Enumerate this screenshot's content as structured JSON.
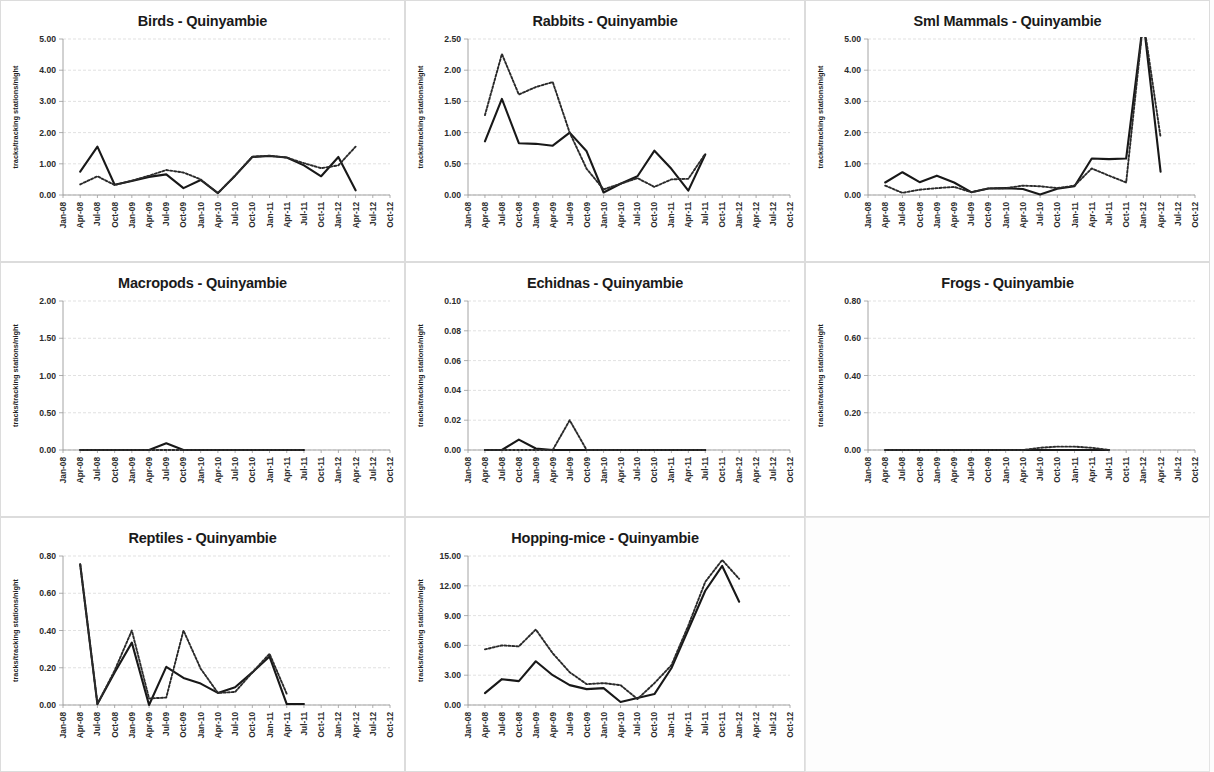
{
  "document": {
    "y_axis_label": "tracks/tracking stations/night",
    "site": "Quinyambie",
    "x_categories": [
      "Jan-08",
      "Apr-08",
      "Jul-08",
      "Oct-08",
      "Jan-09",
      "Apr-09",
      "Jul-09",
      "Oct-09",
      "Jan-10",
      "Apr-10",
      "Jul-10",
      "Oct-10",
      "Jan-11",
      "Apr-11",
      "Jul-11",
      "Oct-11",
      "Jan-12",
      "Apr-12",
      "Jul-12",
      "Oct-12"
    ],
    "colors": {
      "line": "#181818",
      "grid": "#d9d9d9",
      "axis": "#9a9a9a",
      "panel_border": "#dcdcdc",
      "text": "#1a1a1a"
    }
  },
  "chart_data": [
    {
      "id": "birds",
      "type": "line",
      "title": "Birds - Quinyambie",
      "xlabel": "",
      "ylabel": "tracks/tracking stations/night",
      "ylim": [
        0,
        5
      ],
      "yticks": [
        0,
        1,
        2,
        3,
        4,
        5
      ],
      "ytick_labels": [
        "0.00",
        "1.00",
        "2.00",
        "3.00",
        "4.00",
        "5.00"
      ],
      "grid": true,
      "x": [
        "Jan-08",
        "Apr-08",
        "Jul-08",
        "Oct-08",
        "Jan-09",
        "Apr-09",
        "Jul-09",
        "Oct-09",
        "Jan-10",
        "Apr-10",
        "Jul-10",
        "Oct-10",
        "Jan-11",
        "Apr-11",
        "Jul-11",
        "Oct-11",
        "Jan-12",
        "Apr-12",
        "Jul-12",
        "Oct-12"
      ],
      "series": [
        {
          "name": "solid",
          "style": "solid",
          "values": [
            null,
            0.75,
            1.55,
            0.33,
            0.45,
            0.58,
            0.66,
            0.22,
            0.48,
            0.06,
            0.62,
            1.22,
            1.25,
            1.2,
            0.95,
            0.6,
            1.22,
            0.15,
            null,
            null
          ]
        },
        {
          "name": "dotted",
          "style": "dotted",
          "values": [
            null,
            0.34,
            0.6,
            0.32,
            0.46,
            0.62,
            0.8,
            0.72,
            0.5,
            0.06,
            0.62,
            1.23,
            1.26,
            1.2,
            1.02,
            0.86,
            0.95,
            1.55,
            null,
            null
          ]
        }
      ]
    },
    {
      "id": "rabbits",
      "type": "line",
      "title": "Rabbits - Quinyambie",
      "xlabel": "",
      "ylabel": "tracks/tracking stations/night",
      "ylim": [
        0,
        2.5
      ],
      "yticks": [
        0,
        0.5,
        1.0,
        1.5,
        2.0,
        2.5
      ],
      "ytick_labels": [
        "0.00",
        "0.50",
        "1.00",
        "1.50",
        "2.00",
        "2.50"
      ],
      "grid": true,
      "x": [
        "Jan-08",
        "Apr-08",
        "Jul-08",
        "Oct-08",
        "Jan-09",
        "Apr-09",
        "Jul-09",
        "Oct-09",
        "Jan-10",
        "Apr-10",
        "Jul-10",
        "Oct-10",
        "Jan-11",
        "Apr-11",
        "Jul-11",
        "Oct-11",
        "Jan-12",
        "Apr-12",
        "Jul-12",
        "Oct-12"
      ],
      "series": [
        {
          "name": "solid",
          "style": "solid",
          "values": [
            null,
            0.86,
            1.54,
            0.83,
            0.82,
            0.79,
            1.0,
            0.7,
            0.04,
            0.18,
            0.3,
            0.71,
            0.42,
            0.07,
            0.65,
            null,
            null,
            null,
            null,
            null
          ]
        },
        {
          "name": "dotted",
          "style": "dotted",
          "values": [
            null,
            1.28,
            2.26,
            1.61,
            1.73,
            1.81,
            1.0,
            0.42,
            0.09,
            0.18,
            0.27,
            0.13,
            0.25,
            0.26,
            0.66,
            null,
            null,
            null,
            null,
            null
          ]
        }
      ]
    },
    {
      "id": "sml-mammals",
      "type": "line",
      "title": "Sml Mammals - Quinyambie",
      "xlabel": "",
      "ylabel": "tracks/tracking stations/night",
      "ylim": [
        0,
        5
      ],
      "yticks": [
        0,
        1,
        2,
        3,
        4,
        5
      ],
      "ytick_labels": [
        "0.00",
        "1.00",
        "2.00",
        "3.00",
        "4.00",
        "5.00"
      ],
      "grid": true,
      "x": [
        "Jan-08",
        "Apr-08",
        "Jul-08",
        "Oct-08",
        "Jan-09",
        "Apr-09",
        "Jul-09",
        "Oct-09",
        "Jan-10",
        "Apr-10",
        "Jul-10",
        "Oct-10",
        "Jan-11",
        "Apr-11",
        "Jul-11",
        "Oct-11",
        "Jan-12",
        "Apr-12",
        "Jul-12",
        "Oct-12"
      ],
      "series": [
        {
          "name": "solid",
          "style": "solid",
          "values": [
            null,
            0.4,
            0.73,
            0.41,
            0.62,
            0.4,
            0.09,
            0.21,
            0.22,
            0.19,
            0.02,
            0.2,
            0.28,
            1.17,
            1.15,
            1.17,
            5.6,
            0.75,
            null,
            null
          ]
        },
        {
          "name": "dotted",
          "style": "dotted",
          "values": [
            null,
            0.3,
            0.07,
            0.17,
            0.22,
            0.26,
            0.09,
            0.21,
            0.22,
            0.3,
            0.28,
            0.22,
            0.3,
            0.85,
            0.62,
            0.4,
            5.6,
            1.85,
            null,
            null
          ]
        }
      ]
    },
    {
      "id": "macropods",
      "type": "line",
      "title": "Macropods - Quinyambie",
      "xlabel": "",
      "ylabel": "tracks/tracking stations/night",
      "ylim": [
        0,
        2
      ],
      "yticks": [
        0,
        0.5,
        1.0,
        1.5,
        2.0
      ],
      "ytick_labels": [
        "0.00",
        "0.50",
        "1.00",
        "1.50",
        "2.00"
      ],
      "grid": true,
      "x": [
        "Jan-08",
        "Apr-08",
        "Jul-08",
        "Oct-08",
        "Jan-09",
        "Apr-09",
        "Jul-09",
        "Oct-09",
        "Jan-10",
        "Apr-10",
        "Jul-10",
        "Oct-10",
        "Jan-11",
        "Apr-11",
        "Jul-11",
        "Oct-11",
        "Jan-12",
        "Apr-12",
        "Jul-12",
        "Oct-12"
      ],
      "series": [
        {
          "name": "solid",
          "style": "solid",
          "values": [
            null,
            0.0,
            0.0,
            0.0,
            0.0,
            0.0,
            0.09,
            0.0,
            0.0,
            0.0,
            0.0,
            0.0,
            0.0,
            0.0,
            0.0,
            null,
            null,
            null,
            null,
            null
          ]
        },
        {
          "name": "dotted",
          "style": "dotted",
          "values": [
            null,
            0.0,
            0.0,
            0.0,
            0.0,
            0.0,
            0.0,
            0.0,
            0.0,
            0.0,
            0.0,
            0.0,
            0.0,
            0.0,
            0.0,
            null,
            null,
            null,
            null,
            null
          ]
        }
      ]
    },
    {
      "id": "echidnas",
      "type": "line",
      "title": "Echidnas - Quinyambie",
      "xlabel": "",
      "ylabel": "tracks/tracking stations/night",
      "ylim": [
        0,
        0.1
      ],
      "yticks": [
        0,
        0.02,
        0.04,
        0.06,
        0.08,
        0.1
      ],
      "ytick_labels": [
        "0.00",
        "0.02",
        "0.04",
        "0.06",
        "0.08",
        "0.10"
      ],
      "grid": true,
      "x": [
        "Jan-08",
        "Apr-08",
        "Jul-08",
        "Oct-08",
        "Jan-09",
        "Apr-09",
        "Jul-09",
        "Oct-09",
        "Jan-10",
        "Apr-10",
        "Jul-10",
        "Oct-10",
        "Jan-11",
        "Apr-11",
        "Jul-11",
        "Oct-11",
        "Jan-12",
        "Apr-12",
        "Jul-12",
        "Oct-12"
      ],
      "series": [
        {
          "name": "solid",
          "style": "solid",
          "values": [
            null,
            0.0,
            0.0,
            0.007,
            0.001,
            0.0,
            0.0,
            0.0,
            0.0,
            0.0,
            0.0,
            0.0,
            0.0,
            0.0,
            0.0,
            null,
            null,
            null,
            null,
            null
          ]
        },
        {
          "name": "dotted",
          "style": "dotted",
          "values": [
            null,
            0.0,
            0.0,
            0.0,
            0.0,
            0.0,
            0.02,
            0.0,
            0.0,
            0.0,
            0.0,
            0.0,
            0.0,
            0.0,
            0.0,
            null,
            null,
            null,
            null,
            null
          ]
        }
      ]
    },
    {
      "id": "frogs",
      "type": "line",
      "title": "Frogs - Quinyambie",
      "xlabel": "",
      "ylabel": "tracks/tracking stations/night",
      "ylim": [
        0,
        0.8
      ],
      "yticks": [
        0,
        0.2,
        0.4,
        0.6,
        0.8
      ],
      "ytick_labels": [
        "0.00",
        "0.20",
        "0.40",
        "0.60",
        "0.80"
      ],
      "grid": true,
      "x": [
        "Jan-08",
        "Apr-08",
        "Jul-08",
        "Oct-08",
        "Jan-09",
        "Apr-09",
        "Jul-09",
        "Oct-09",
        "Jan-10",
        "Apr-10",
        "Jul-10",
        "Oct-10",
        "Jan-11",
        "Apr-11",
        "Jul-11",
        "Oct-11",
        "Jan-12",
        "Apr-12",
        "Jul-12",
        "Oct-12"
      ],
      "series": [
        {
          "name": "solid",
          "style": "solid",
          "values": [
            null,
            0.0,
            0.0,
            0.0,
            0.0,
            0.0,
            0.0,
            0.0,
            0.0,
            0.0,
            0.0,
            0.0,
            0.0,
            0.0,
            0.0,
            null,
            null,
            null,
            null,
            null
          ]
        },
        {
          "name": "dotted",
          "style": "dotted",
          "values": [
            null,
            0.0,
            0.0,
            0.0,
            0.0,
            0.0,
            0.0,
            0.0,
            0.0,
            0.0,
            0.012,
            0.018,
            0.018,
            0.012,
            0.0,
            null,
            null,
            null,
            null,
            null
          ]
        }
      ]
    },
    {
      "id": "reptiles",
      "type": "line",
      "title": "Reptiles - Quinyambie",
      "xlabel": "",
      "ylabel": "tracks/tracking stations/night",
      "ylim": [
        0,
        0.8
      ],
      "yticks": [
        0,
        0.2,
        0.4,
        0.6,
        0.8
      ],
      "ytick_labels": [
        "0.00",
        "0.20",
        "0.40",
        "0.60",
        "0.80"
      ],
      "grid": true,
      "x": [
        "Jan-08",
        "Apr-08",
        "Jul-08",
        "Oct-08",
        "Jan-09",
        "Apr-09",
        "Jul-09",
        "Oct-09",
        "Jan-10",
        "Apr-10",
        "Jul-10",
        "Oct-10",
        "Jan-11",
        "Apr-11",
        "Jul-11",
        "Oct-11",
        "Jan-12",
        "Apr-12",
        "Jul-12",
        "Oct-12"
      ],
      "series": [
        {
          "name": "solid",
          "style": "solid",
          "values": [
            null,
            0.755,
            0.005,
            0.175,
            0.335,
            0.0,
            0.205,
            0.145,
            0.115,
            0.065,
            0.095,
            0.175,
            0.26,
            0.005,
            0.005,
            null,
            null,
            null,
            null,
            null
          ]
        },
        {
          "name": "dotted",
          "style": "dotted",
          "values": [
            null,
            0.755,
            0.005,
            0.185,
            0.4,
            0.035,
            0.04,
            0.4,
            0.195,
            0.065,
            0.07,
            0.175,
            0.275,
            0.06,
            null,
            null,
            null,
            null,
            null,
            null
          ]
        }
      ]
    },
    {
      "id": "hopping-mice",
      "type": "line",
      "title": "Hopping-mice - Quinyambie",
      "xlabel": "",
      "ylabel": "tracks/tracking stations/night",
      "ylim": [
        0,
        15
      ],
      "yticks": [
        0,
        3,
        6,
        9,
        12,
        15
      ],
      "ytick_labels": [
        "0.00",
        "3.00",
        "6.00",
        "9.00",
        "12.00",
        "15.00"
      ],
      "grid": true,
      "x": [
        "Jan-08",
        "Apr-08",
        "Jul-08",
        "Oct-08",
        "Jan-09",
        "Apr-09",
        "Jul-09",
        "Oct-09",
        "Jan-10",
        "Apr-10",
        "Jul-10",
        "Oct-10",
        "Jan-11",
        "Apr-11",
        "Jul-11",
        "Oct-11",
        "Jan-12",
        "Apr-12",
        "Jul-12",
        "Oct-12"
      ],
      "series": [
        {
          "name": "solid",
          "style": "solid",
          "values": [
            null,
            1.2,
            2.6,
            2.4,
            4.4,
            3.0,
            2.0,
            1.6,
            1.7,
            0.3,
            0.7,
            1.1,
            3.7,
            7.6,
            11.5,
            14.0,
            10.4,
            null,
            null,
            null
          ]
        },
        {
          "name": "dotted",
          "style": "dotted",
          "values": [
            null,
            5.6,
            6.0,
            5.9,
            7.6,
            5.2,
            3.3,
            2.1,
            2.2,
            2.0,
            0.6,
            2.2,
            4.0,
            8.0,
            12.4,
            14.6,
            12.7,
            null,
            null,
            null
          ]
        }
      ]
    }
  ],
  "layout": {
    "rows": [
      [
        "birds",
        "rabbits",
        "sml-mammals"
      ],
      [
        "macropods",
        "echidnas",
        "frogs"
      ],
      [
        "reptiles",
        "hopping-mice",
        null
      ]
    ]
  }
}
